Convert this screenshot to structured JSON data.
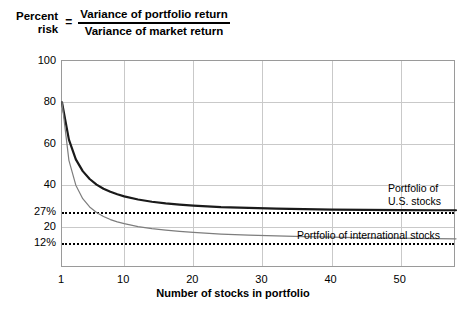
{
  "formula": {
    "lhs_line1": "Percent",
    "lhs_line2": "risk",
    "equals": "=",
    "numerator": "Variance of portfolio return",
    "denominator": "Variance of market return"
  },
  "chart_data": {
    "type": "line",
    "xlabel": "Number of stocks in portfolio",
    "ylabel": "",
    "xlim": [
      1,
      58
    ],
    "ylim": [
      0,
      100
    ],
    "grid": true,
    "legend_position": "inline-annotations",
    "x_ticks": [
      "1",
      "10",
      "20",
      "30",
      "40",
      "50"
    ],
    "x_tick_values": [
      1,
      10,
      20,
      30,
      40,
      50
    ],
    "y_ticks": [
      "100",
      "80",
      "60",
      "40",
      "27%",
      "20",
      "12%"
    ],
    "y_tick_values": [
      100,
      80,
      60,
      40,
      27,
      20,
      12
    ],
    "annotations": [
      {
        "text_line1": "Portfolio of",
        "text_line2": "U.S. stocks",
        "value": 27
      },
      {
        "text_line1": "Portfolio of international stocks",
        "text_line2": "",
        "value": 12
      }
    ],
    "asymptotes": [
      {
        "label": "27%",
        "value": 27,
        "style": "dotted"
      },
      {
        "label": "12%",
        "value": 12,
        "style": "dotted"
      }
    ],
    "series": [
      {
        "name": "Portfolio of U.S. stocks",
        "color": "#1a1a1a",
        "width": 2.2,
        "asymptote": 27,
        "x": [
          1,
          2,
          3,
          4,
          5,
          6,
          7,
          8,
          9,
          10,
          12,
          14,
          16,
          18,
          20,
          24,
          28,
          32,
          36,
          40,
          45,
          50,
          55,
          58
        ],
        "values": [
          80.0,
          62.0,
          52.5,
          46.8,
          43.0,
          40.3,
          38.3,
          36.8,
          35.6,
          34.6,
          33.1,
          32.0,
          31.2,
          30.6,
          30.1,
          29.4,
          29.0,
          28.7,
          28.4,
          28.2,
          28.1,
          28.0,
          27.9,
          27.9
        ]
      },
      {
        "name": "Portfolio of international stocks",
        "color": "#7d7d7d",
        "width": 1.2,
        "asymptote": 12,
        "x": [
          1,
          2,
          3,
          4,
          5,
          6,
          7,
          8,
          9,
          10,
          12,
          14,
          16,
          18,
          20,
          24,
          28,
          32,
          36,
          40,
          45,
          50,
          55,
          58
        ],
        "values": [
          80.0,
          52.0,
          40.0,
          33.5,
          29.5,
          26.8,
          24.9,
          23.4,
          22.3,
          21.4,
          20.0,
          19.0,
          18.3,
          17.7,
          17.2,
          16.4,
          15.9,
          15.5,
          15.2,
          14.9,
          14.6,
          14.4,
          14.2,
          14.1
        ]
      }
    ]
  }
}
